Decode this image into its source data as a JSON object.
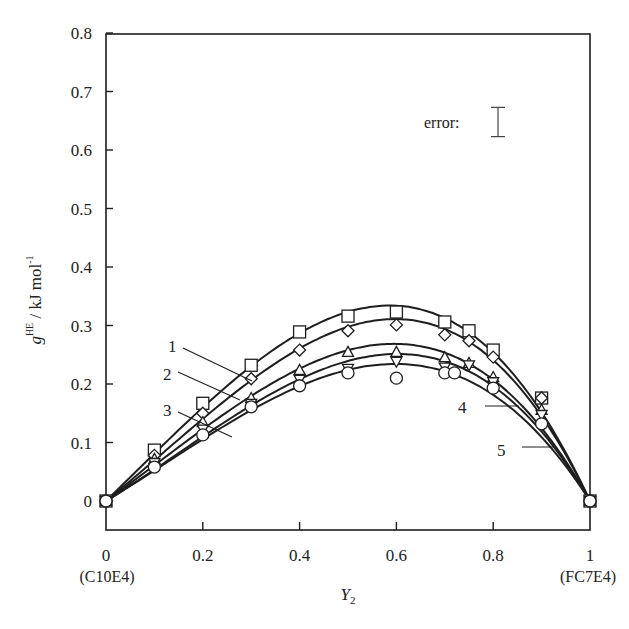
{
  "chart_data": {
    "type": "line",
    "title": "",
    "xlabel": "Y",
    "xlabel_sub": "2",
    "ylabel_main": "g",
    "ylabel_sup": "HE",
    "ylabel_units": " / kJ mol",
    "ylabel_units_sup": "-1",
    "xlim": [
      0,
      1
    ],
    "ylim": [
      -0.05,
      0.8
    ],
    "xticks": [
      0,
      0.2,
      0.4,
      0.6,
      0.8,
      1
    ],
    "xtick_labels": [
      "0",
      "0.2",
      "0.4",
      "0.6",
      "0.8",
      "1"
    ],
    "yticks": [
      0,
      0.1,
      0.2,
      0.3,
      0.4,
      0.5,
      0.6,
      0.7,
      0.8
    ],
    "ytick_labels": [
      "0",
      "0.1",
      "0.2",
      "0.3",
      "0.4",
      "0.5",
      "0.6",
      "0.7",
      "0.8"
    ],
    "x_end_labels": {
      "left": "(C10E4)",
      "right": "(FC7E4)"
    },
    "grid": false,
    "error_bar": {
      "label": "error:",
      "half_width": 0.025
    },
    "series": [
      {
        "name": "1",
        "marker": "square",
        "x": [
          0,
          0.1,
          0.2,
          0.3,
          0.4,
          0.5,
          0.6,
          0.7,
          0.75,
          0.8,
          0.9,
          1
        ],
        "y": [
          0,
          0.087,
          0.167,
          0.232,
          0.289,
          0.316,
          0.323,
          0.306,
          0.291,
          0.258,
          0.176,
          0
        ]
      },
      {
        "name": "2",
        "marker": "diamond",
        "x": [
          0,
          0.1,
          0.2,
          0.3,
          0.4,
          0.5,
          0.6,
          0.7,
          0.75,
          0.8,
          0.9,
          1
        ],
        "y": [
          0,
          0.078,
          0.15,
          0.209,
          0.258,
          0.291,
          0.301,
          0.284,
          0.274,
          0.246,
          0.176,
          0
        ]
      },
      {
        "name": "3",
        "marker": "triangle-up",
        "x": [
          0,
          0.1,
          0.2,
          0.3,
          0.4,
          0.5,
          0.6,
          0.7,
          0.75,
          0.8,
          0.9,
          1
        ],
        "y": [
          0,
          0.072,
          0.135,
          0.176,
          0.224,
          0.255,
          0.255,
          0.246,
          0.236,
          0.212,
          0.156,
          0
        ]
      },
      {
        "name": "4",
        "marker": "triangle-down",
        "x": [
          0,
          0.1,
          0.2,
          0.3,
          0.4,
          0.5,
          0.6,
          0.7,
          0.75,
          0.8,
          0.9,
          1
        ],
        "y": [
          0,
          0.065,
          0.122,
          0.166,
          0.207,
          0.226,
          0.238,
          0.228,
          0.232,
          0.203,
          0.147,
          0
        ]
      },
      {
        "name": "5",
        "marker": "circle",
        "x": [
          0,
          0.1,
          0.2,
          0.3,
          0.4,
          0.5,
          0.6,
          0.7,
          0.72,
          0.8,
          0.9,
          1
        ],
        "y": [
          0,
          0.058,
          0.113,
          0.161,
          0.197,
          0.219,
          0.21,
          0.219,
          0.219,
          0.193,
          0.132,
          0
        ]
      }
    ],
    "curve_labels": [
      {
        "text": "1",
        "series": "1"
      },
      {
        "text": "2",
        "series": "2"
      },
      {
        "text": "3",
        "series": "3"
      },
      {
        "text": "4",
        "series": "4"
      },
      {
        "text": "5",
        "series": "5"
      }
    ]
  }
}
